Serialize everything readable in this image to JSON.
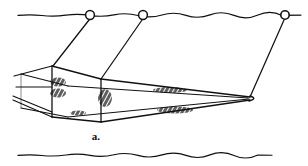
{
  "figure": {
    "caption": "a.",
    "background_color": "#ffffff",
    "ink_color": "#111111"
  },
  "water_surface": {
    "name": "water-surface-line",
    "y": 15,
    "x_start": 18,
    "x_end": 301,
    "style": "wavy-hand-drawn"
  },
  "sea_bed": {
    "name": "sea-bed-line",
    "y": 155,
    "x_start": 18,
    "x_end": 272,
    "style": "wavy-hand-drawn"
  },
  "floats": [
    {
      "label": "float-1",
      "cx": 90,
      "cy": 15,
      "r": 4.5
    },
    {
      "label": "float-2",
      "cx": 143,
      "cy": 15,
      "r": 4.5
    },
    {
      "label": "float-3",
      "cx": 285,
      "cy": 15,
      "r": 4.5
    }
  ],
  "warp_lines": [
    {
      "label": "warp-line-left",
      "d": "M 89 20 L 53 66"
    },
    {
      "label": "warp-line-middle",
      "d": "M 142 20 L 101 79"
    },
    {
      "label": "warp-line-right",
      "d": "M 284 20 Q 268 56 250 97"
    }
  ],
  "net_mouth_frame": {
    "name": "net-mouth-frame",
    "top_front": "M 52 66 L 101 79",
    "left_post": "M 52 66 L 52 117",
    "right_post": "M 101 79 L 101 122",
    "bottom_front": "M 52 117 L 101 122",
    "top_back": "M 21 74 L 68 86",
    "left_back_post": "M 21 74 L 21 109",
    "bottom_back": "M 21 109 L 68 117"
  },
  "net_body": {
    "name": "net-body-taper",
    "upper_panel": "M 101 79 L 250 97",
    "lower_panel": "M 101 122 L 250 99",
    "wing_upper": "M 52 66 L 14 76",
    "wing_mid": "M 16 87 L 52 87",
    "wing_lower_a": "M 13 96 L 52 112",
    "wing_lower_b": "M 13 100 L 52 117",
    "cod_end_tip": {
      "x": 250,
      "y": 98
    },
    "cod_end_curve": "M 250 97 Q 257 98 250 100"
  },
  "shading_patches": [
    {
      "label": "shade-mouth-upper-left",
      "cx": 58,
      "cy": 82,
      "w": 16,
      "h": 9
    },
    {
      "label": "shade-mouth-lower-left",
      "cx": 58,
      "cy": 93,
      "w": 16,
      "h": 9
    },
    {
      "label": "shade-mouth-center",
      "cx": 105,
      "cy": 98,
      "w": 14,
      "h": 18
    },
    {
      "label": "shade-belly-left",
      "cx": 78,
      "cy": 113,
      "w": 16,
      "h": 5
    },
    {
      "label": "shade-upper-panel",
      "cx": 170,
      "cy": 90,
      "w": 34,
      "h": 6
    },
    {
      "label": "shade-lower-panel",
      "cx": 175,
      "cy": 110,
      "w": 36,
      "h": 7
    }
  ]
}
